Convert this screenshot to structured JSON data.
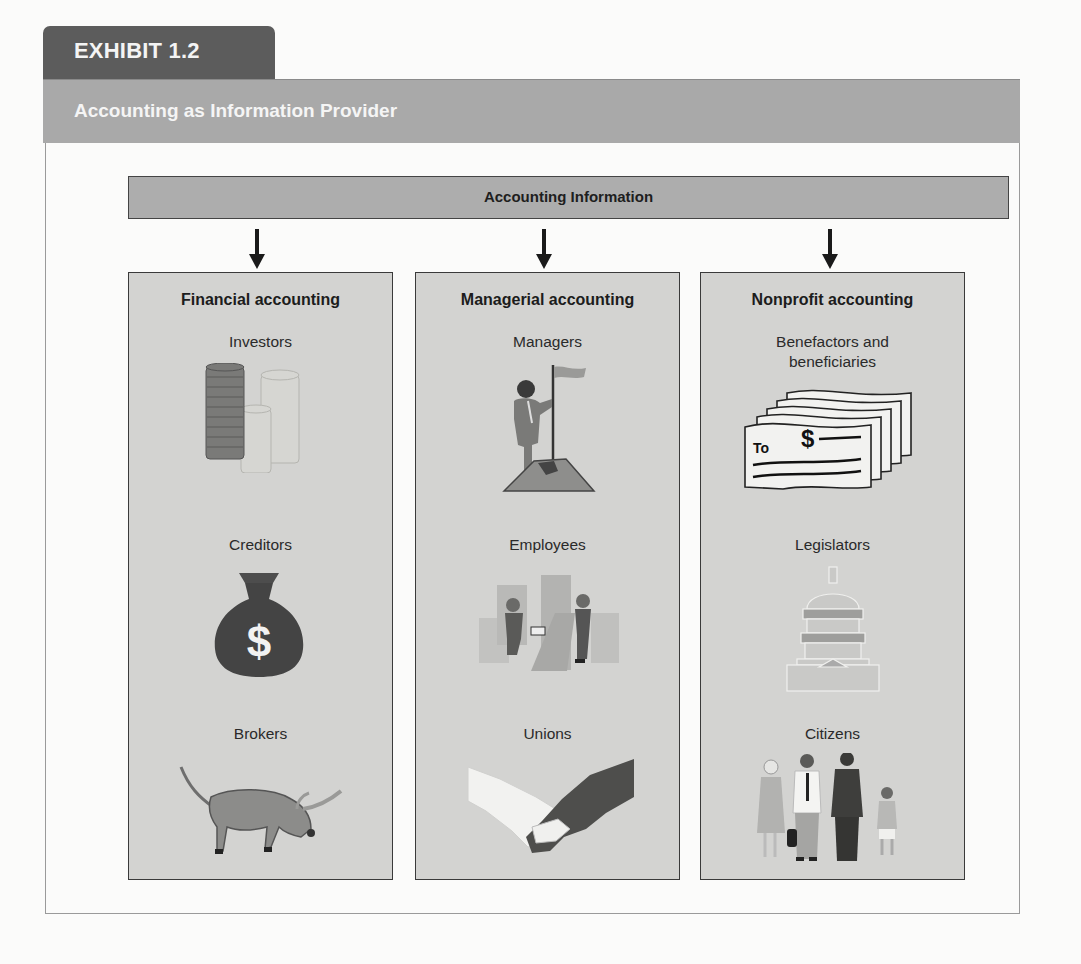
{
  "exhibit": {
    "label": "EXHIBIT 1.2",
    "title": "Accounting as Information Provider"
  },
  "diagram": {
    "root": "Accounting Information",
    "columns": [
      {
        "heading": "Financial accounting",
        "groups": [
          {
            "label": "Investors",
            "icon": "coin-stacks-icon"
          },
          {
            "label": "Creditors",
            "icon": "money-bag-icon"
          },
          {
            "label": "Brokers",
            "icon": "bull-icon"
          }
        ]
      },
      {
        "heading": "Managerial accounting",
        "groups": [
          {
            "label": "Managers",
            "icon": "manager-flag-icon"
          },
          {
            "label": "Employees",
            "icon": "employees-icon"
          },
          {
            "label": "Unions",
            "icon": "handshake-icon"
          }
        ]
      },
      {
        "heading": "Nonprofit accounting",
        "groups": [
          {
            "label": "Benefactors and beneficiaries",
            "icon": "checks-icon"
          },
          {
            "label": "Legislators",
            "icon": "capitol-icon"
          },
          {
            "label": "Citizens",
            "icon": "citizens-icon"
          }
        ]
      }
    ],
    "check_text": {
      "to": "To",
      "dollar": "$"
    },
    "money_bag_symbol": "$"
  },
  "colors": {
    "tab": "#5c5c5c",
    "title_bar": "#a9a9a9",
    "info_bar": "#adadad",
    "column_bg": "#d3d3d1",
    "border": "#3a3a3a"
  }
}
